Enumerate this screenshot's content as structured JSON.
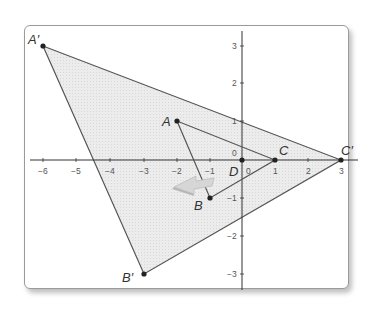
{
  "diagram": {
    "type": "dilation-coordinate-plane",
    "colors": {
      "frame_border": "#9a9a9a",
      "axis": "#333333",
      "triangle_edge": "#555555",
      "image_fill": "#e6e6e6",
      "point": "#222222",
      "arrow": "#cfcfcf"
    },
    "x_ticks": [
      {
        "value": -6,
        "label": "−6"
      },
      {
        "value": -5,
        "label": "−5"
      },
      {
        "value": -4,
        "label": "−4"
      },
      {
        "value": -3,
        "label": "−3"
      },
      {
        "value": -2,
        "label": "−2"
      },
      {
        "value": -1,
        "label": "−1"
      },
      {
        "value": 0,
        "label": "0"
      },
      {
        "value": 1,
        "label": "1"
      },
      {
        "value": 2,
        "label": "2"
      },
      {
        "value": 3,
        "label": "3"
      }
    ],
    "y_ticks": [
      {
        "value": 3,
        "label": "3"
      },
      {
        "value": 2,
        "label": "2"
      },
      {
        "value": 1,
        "label": "1"
      },
      {
        "value": 0,
        "label": "0"
      },
      {
        "value": -1,
        "label": "−1"
      },
      {
        "value": -2,
        "label": "−2"
      },
      {
        "value": -3,
        "label": "−3"
      }
    ],
    "points": {
      "A_prime": {
        "label": "A′",
        "x": -6,
        "y": 3
      },
      "A": {
        "label": "A",
        "x": -2,
        "y": 1
      },
      "B": {
        "label": "B",
        "x": -1,
        "y": -1
      },
      "B_prime": {
        "label": "B′",
        "x": -3,
        "y": -3
      },
      "C": {
        "label": "C",
        "x": 1,
        "y": 0
      },
      "C_prime": {
        "label": "C′",
        "x": 3,
        "y": 0
      },
      "D": {
        "label": "D",
        "x": 0,
        "y": 0
      }
    },
    "original_triangle": [
      "A",
      "B",
      "C"
    ],
    "image_triangle": [
      "A′",
      "B′",
      "C′"
    ]
  }
}
